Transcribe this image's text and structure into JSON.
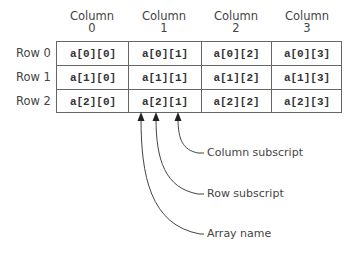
{
  "diagram": {
    "column_headers": [
      {
        "line1": "Column",
        "line2": "0"
      },
      {
        "line1": "Column",
        "line2": "1"
      },
      {
        "line1": "Column",
        "line2": "2"
      },
      {
        "line1": "Column",
        "line2": "3"
      }
    ],
    "row_labels": [
      "Row 0",
      "Row 1",
      "Row 2"
    ],
    "cells": [
      [
        "a[0][0]",
        "a[0][1]",
        "a[0][2]",
        "a[0][3]"
      ],
      [
        "a[1][0]",
        "a[1][1]",
        "a[1][2]",
        "a[1][3]"
      ],
      [
        "a[2][0]",
        "a[2][1]",
        "a[2][2]",
        "a[2][3]"
      ]
    ],
    "annotations": {
      "column_subscript": "Column subscript",
      "row_subscript": "Row subscript",
      "array_name": "Array name"
    },
    "colors": {
      "line": "#666666",
      "text": "#444444"
    }
  }
}
